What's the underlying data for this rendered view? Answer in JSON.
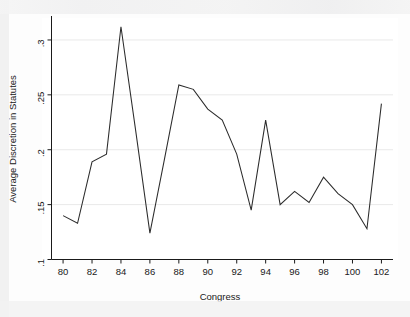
{
  "chart_data": {
    "type": "line",
    "title": "",
    "xlabel": "Congress",
    "ylabel": "Average Discretion in Statutes",
    "xlim": [
      79.2,
      102.8
    ],
    "ylim": [
      0.1,
      0.32
    ],
    "xticks": [
      80,
      82,
      84,
      86,
      88,
      90,
      92,
      94,
      96,
      98,
      100,
      102
    ],
    "xtick_labels": [
      "80",
      "82",
      "84",
      "86",
      "88",
      "90",
      "92",
      "94",
      "96",
      "98",
      "100",
      "102"
    ],
    "yticks": [
      0.1,
      0.15,
      0.2,
      0.25,
      0.3
    ],
    "ytick_labels": [
      ".1",
      ".15",
      ".2",
      ".25",
      ".3"
    ],
    "grid": true,
    "grid_axis": "y",
    "legend": "none",
    "line_color": "#2b2b2b",
    "x": [
      80,
      81,
      82,
      83,
      84,
      85,
      86,
      87,
      88,
      89,
      90,
      91,
      92,
      93,
      94,
      95,
      96,
      97,
      98,
      99,
      100,
      101,
      102
    ],
    "values": [
      0.14,
      0.133,
      0.189,
      0.196,
      0.312,
      0.219,
      0.124,
      0.191,
      0.259,
      0.255,
      0.237,
      0.227,
      0.196,
      0.145,
      0.227,
      0.15,
      0.162,
      0.152,
      0.175,
      0.16,
      0.15,
      0.128,
      0.242
    ],
    "series": [
      {
        "name": "Average Discretion in Statutes",
        "values": [
          0.14,
          0.133,
          0.189,
          0.196,
          0.312,
          0.219,
          0.124,
          0.191,
          0.259,
          0.255,
          0.237,
          0.227,
          0.196,
          0.145,
          0.227,
          0.15,
          0.162,
          0.152,
          0.175,
          0.16,
          0.15,
          0.128,
          0.242
        ]
      }
    ]
  },
  "axes": {
    "x_title": "Congress",
    "y_title": "Average Discretion in Statutes"
  }
}
